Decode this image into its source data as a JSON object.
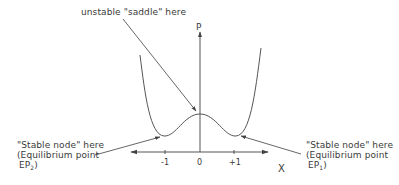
{
  "annotations": {
    "saddle": "unstable \"saddle\" here",
    "left_node": {
      "line1": "\"Stable node\" here",
      "line2": "(Equilibrium point",
      "line3_prefix": "EP",
      "line3_sub": "2",
      "line3_suffix": ")"
    },
    "right_node": {
      "line1": "\"Stable node\" here",
      "line2": "(Equilibrium point",
      "line3_prefix": "EP",
      "line3_sub": "1",
      "line3_suffix": ")"
    }
  },
  "axes": {
    "y_label": "P",
    "x_label": "X",
    "ticks": [
      "-1",
      "0",
      "+1"
    ]
  },
  "colors": {
    "line": "#444444",
    "text": "#3a3a3a"
  }
}
